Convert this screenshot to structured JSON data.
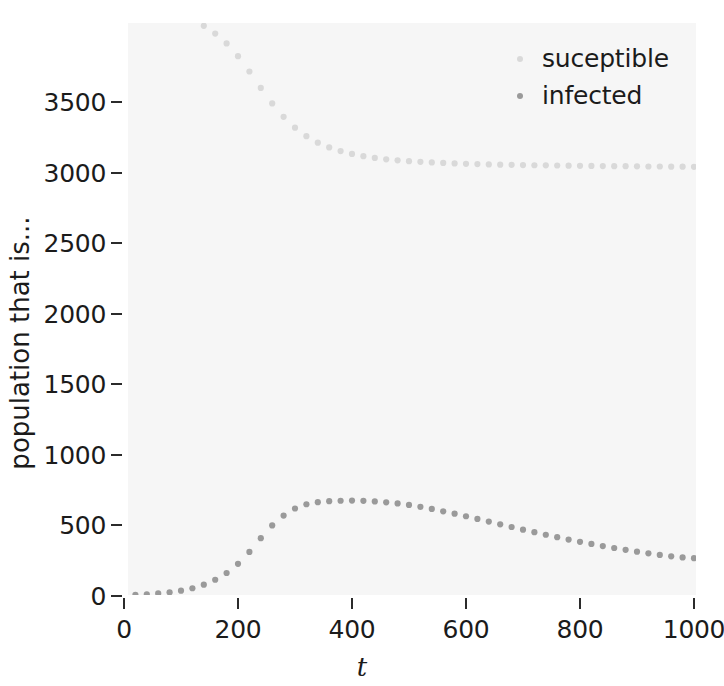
{
  "chart_data": {
    "type": "scatter",
    "title": "",
    "xlabel": "t",
    "ylabel": "population that is...",
    "xlim": [
      0,
      1010
    ],
    "ylim": [
      0,
      4050
    ],
    "xticks": [
      0,
      200,
      400,
      600,
      800,
      1000
    ],
    "xtick_labels": [
      "0",
      "200",
      "400",
      "600",
      "800",
      "1000"
    ],
    "yticks": [
      0,
      500,
      1000,
      1500,
      2000,
      2500,
      3000,
      3500
    ],
    "ytick_labels": [
      "0",
      "500",
      "1000",
      "1500",
      "2000",
      "2500",
      "3000",
      "3500"
    ],
    "grid": false,
    "legend_position": "top-right",
    "panel_background": "#f6f6f6",
    "marker_size": 5,
    "series": [
      {
        "name": "suceptible",
        "color": "#d9d9d9",
        "x": [
          0,
          20,
          40,
          60,
          80,
          100,
          120,
          140,
          160,
          180,
          200,
          220,
          240,
          260,
          280,
          300,
          320,
          340,
          360,
          380,
          400,
          420,
          440,
          460,
          480,
          500,
          520,
          540,
          560,
          580,
          600,
          620,
          640,
          660,
          680,
          700,
          720,
          740,
          760,
          780,
          800,
          820,
          840,
          860,
          880,
          900,
          920,
          940,
          960,
          980,
          1000
        ],
        "y": [
          4200,
          4190,
          4178,
          4162,
          4142,
          4116,
          4082,
          4040,
          3985,
          3915,
          3825,
          3716,
          3600,
          3490,
          3395,
          3318,
          3258,
          3212,
          3178,
          3152,
          3132,
          3116,
          3104,
          3094,
          3087,
          3081,
          3076,
          3072,
          3068,
          3065,
          3062,
          3060,
          3058,
          3056,
          3055,
          3053,
          3052,
          3051,
          3050,
          3049,
          3048,
          3047,
          3046,
          3045,
          3045,
          3044,
          3043,
          3043,
          3042,
          3042,
          3041
        ]
      },
      {
        "name": "infected",
        "color": "#9a9a9a",
        "x": [
          0,
          20,
          40,
          60,
          80,
          100,
          120,
          140,
          160,
          180,
          200,
          220,
          240,
          260,
          280,
          300,
          320,
          340,
          360,
          380,
          400,
          420,
          440,
          460,
          480,
          500,
          520,
          540,
          560,
          580,
          600,
          620,
          640,
          660,
          680,
          700,
          720,
          740,
          760,
          780,
          800,
          820,
          840,
          860,
          880,
          900,
          920,
          940,
          960,
          980,
          1000
        ],
        "y": [
          5,
          8,
          12,
          18,
          26,
          38,
          55,
          80,
          115,
          163,
          228,
          312,
          410,
          500,
          570,
          620,
          650,
          665,
          672,
          675,
          676,
          674,
          670,
          664,
          656,
          645,
          632,
          617,
          600,
          583,
          565,
          546,
          527,
          508,
          489,
          470,
          452,
          434,
          417,
          400,
          384,
          369,
          354,
          340,
          327,
          314,
          302,
          291,
          281,
          273,
          268
        ]
      }
    ]
  },
  "legend": {
    "items": [
      {
        "label": "suceptible",
        "color": "#d9d9d9"
      },
      {
        "label": "infected",
        "color": "#9a9a9a"
      }
    ]
  },
  "axes": {
    "x_title": "t",
    "y_title": "population that is..."
  }
}
